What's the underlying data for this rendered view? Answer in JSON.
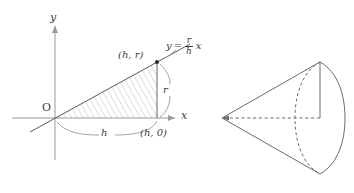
{
  "figure": {
    "background_color": "#ffffff",
    "line_color": "#6a6a6a",
    "axis_color": "#9a9a9a",
    "label_color": "#3d3d3d"
  },
  "left_diagram": {
    "name": "triangle-region-graph",
    "axis_y_label": "y",
    "axis_x_label": "x",
    "origin_label": "O",
    "equation": {
      "lhs": "y",
      "equals": "=",
      "numerator": "r",
      "denominator": "h",
      "variable": "x",
      "full_text": "y = (r/h) x"
    },
    "points": [
      {
        "label": "(h, r)",
        "x": "h",
        "y": "r",
        "marker": "filled-dot"
      },
      {
        "label": "(h, 0)",
        "x": "h",
        "y": "0",
        "marker": "none"
      }
    ],
    "dimension_labels": {
      "base": "h",
      "height": "r"
    },
    "shading": "diagonal-hatch"
  },
  "right_diagram": {
    "name": "cone-solid",
    "description": "Right circular cone with apex at left and circular base at right",
    "apex": "vertex",
    "base": "ellipse",
    "hidden_edges": "dashed",
    "axis_line": "dashed",
    "radius_line": "solid"
  }
}
